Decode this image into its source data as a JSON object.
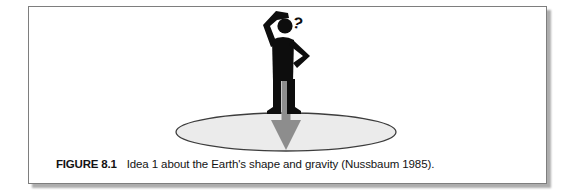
{
  "figure": {
    "label": "FIGURE 8.1",
    "caption": "Idea 1 about the Earth's shape and gravity (Nussbaum 1985).",
    "question_mark": "?",
    "colors": {
      "person_silhouette": "#0d0d0d",
      "gravity_arrow": "#8d8d8d",
      "earth_disc_fill": "#ebebeb",
      "earth_disc_outline": "#3d3d3d",
      "panel_border": "#7e7e7e",
      "panel_shadow": "#adadad",
      "caption_text": "#141414"
    }
  }
}
